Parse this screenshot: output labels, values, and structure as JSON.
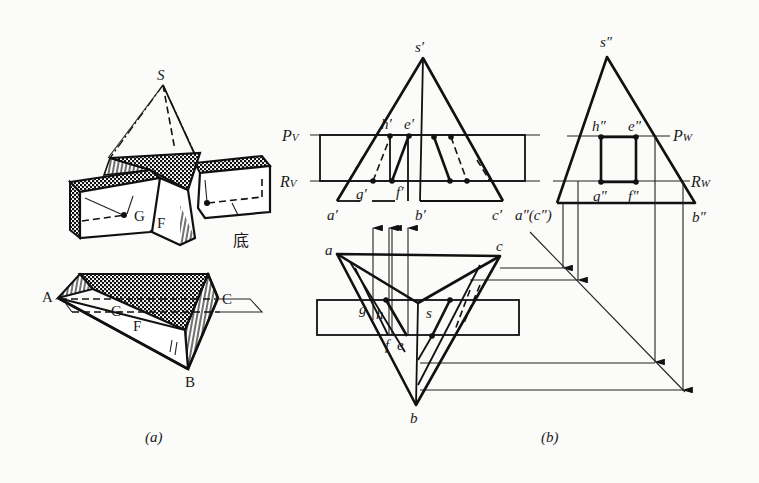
{
  "figure": {
    "caption_a": "(a)",
    "caption_b": "(b)",
    "panel_a": {
      "title": "Pictorial view of triangular pyramid with horizontal slot",
      "labels": {
        "apex": "S",
        "point_G": "G",
        "point_F": "F",
        "base_note": "底",
        "A": "A",
        "B": "B",
        "C": "C",
        "G2": "G",
        "F2": "F"
      }
    },
    "panel_b": {
      "front_view": {
        "apex": "s′",
        "a": "a′",
        "b": "b′",
        "c": "c′",
        "h": "h′",
        "e": "e′",
        "g": "g′",
        "f": "f′",
        "plane_P": "P",
        "plane_P_sub": "V",
        "plane_R": "R",
        "plane_R_sub": "V"
      },
      "side_view": {
        "apex": "s″",
        "ac": "a″(c″)",
        "b": "b″",
        "h": "h″",
        "e": "e″",
        "g": "g″",
        "f": "f″",
        "plane_P": "P",
        "plane_P_sub": "W",
        "plane_R": "R",
        "plane_R_sub": "W"
      },
      "top_view": {
        "a": "a",
        "b": "b",
        "c": "c",
        "s": "s",
        "g": "g",
        "h": "h",
        "f": "f",
        "e": "e"
      }
    }
  }
}
